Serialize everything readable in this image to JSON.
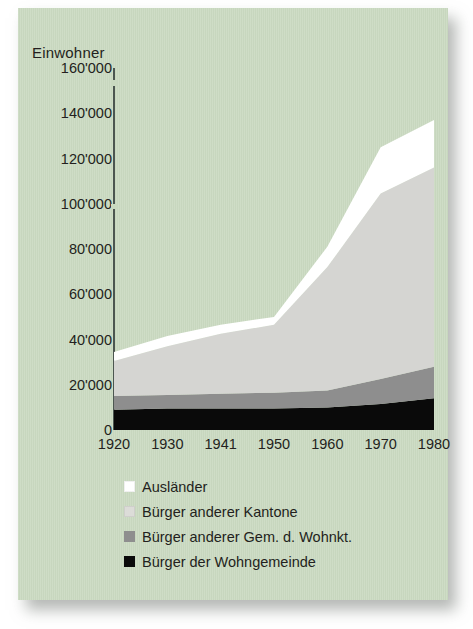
{
  "card": {
    "background_color": "#c9d9c0"
  },
  "chart_data": {
    "type": "area",
    "title": "Einwohner",
    "xlabel": "",
    "ylabel": "Einwohner",
    "stacked": true,
    "grid": false,
    "legend_position": "bottom-left",
    "ylim": [
      0,
      160000
    ],
    "yticks": [
      "0",
      "20'000",
      "40'000",
      "60'000",
      "80'000",
      "100'000",
      "120'000",
      "140'000",
      "160'000"
    ],
    "ytick_values": [
      0,
      20000,
      40000,
      60000,
      80000,
      100000,
      120000,
      140000,
      160000
    ],
    "categories": [
      "1920",
      "1930",
      "1941",
      "1950",
      "1960",
      "1970",
      "1980"
    ],
    "x": [
      1920,
      1930,
      1941,
      1950,
      1960,
      1970,
      1980
    ],
    "series": [
      {
        "name": "Bürger der Wohngemeinde",
        "color": "#0a0a0a",
        "values": [
          9000,
          9500,
          9500,
          9500,
          10000,
          11500,
          14000
        ]
      },
      {
        "name": "Bürger anderer Gem. d. Wohnkt.",
        "color": "#8e8e8e",
        "values": [
          6000,
          6000,
          6500,
          7000,
          7500,
          11000,
          14000
        ]
      },
      {
        "name": "Bürger anderer Kantone",
        "color": "#d5d5d2",
        "values": [
          15500,
          21500,
          26500,
          30000,
          54500,
          82000,
          88000
        ]
      },
      {
        "name": "Ausländer",
        "color": "#ffffff",
        "values": [
          4000,
          4500,
          4000,
          3500,
          9000,
          20500,
          21000
        ]
      }
    ],
    "totals": [
      34500,
      41500,
      46500,
      50000,
      81000,
      125000,
      137000
    ]
  },
  "legend": {
    "items": [
      {
        "label": "Ausländer",
        "color": "#ffffff"
      },
      {
        "label": "Bürger anderer Kantone",
        "color": "#dcdcd8"
      },
      {
        "label": "Bürger anderer Gem. d. Wohnkt.",
        "color": "#8e8e8e"
      },
      {
        "label": "Bürger der Wohngemeinde",
        "color": "#0a0a0a"
      }
    ]
  }
}
